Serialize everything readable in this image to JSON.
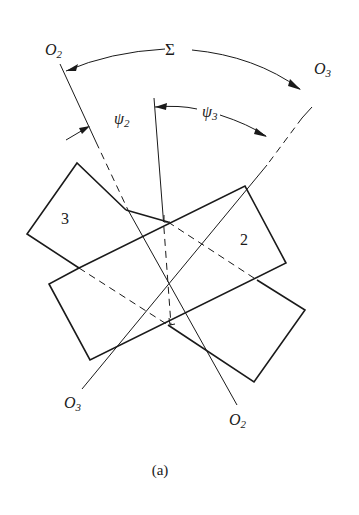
{
  "figure": {
    "caption": "(a)",
    "labels": {
      "sigma": "Σ",
      "psi2_base": "ψ",
      "psi2_sub": "2",
      "psi3_base": "ψ",
      "psi3_sub": "3",
      "O2_top_base": "O",
      "O2_top_sub": "2",
      "O3_top_base": "O",
      "O3_top_sub": "3",
      "O3_bottom_base": "O",
      "O3_bottom_sub": "3",
      "O2_bottom_base": "O",
      "O2_bottom_sub": "2",
      "gear3": "3",
      "gear2": "2"
    },
    "colors": {
      "stroke": "#1a1a1a",
      "background": "#ffffff"
    }
  }
}
